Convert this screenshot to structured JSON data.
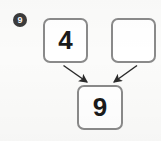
{
  "worksheet": {
    "question_marker": "9",
    "marker_color": "#3b3b3b",
    "box_border_color": "#8a8a8a",
    "arrow_color": "#2b2b2b",
    "background_color": "#fbfbfa"
  },
  "diagram": {
    "type": "number-bond",
    "addend_1": "4",
    "addend_2": "",
    "sum": "9",
    "arrows": [
      {
        "name": "arrow-addend-1-to-sum",
        "from": "addend-1",
        "to": "sum",
        "direction": "down-right"
      },
      {
        "name": "arrow-addend-2-to-sum",
        "from": "addend-2",
        "to": "sum",
        "direction": "down-left"
      }
    ]
  }
}
